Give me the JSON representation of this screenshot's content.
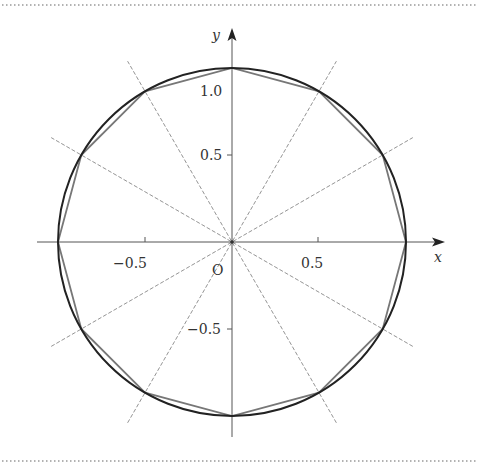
{
  "figure": {
    "type": "unit-circle-with-inscribed-dodecagon",
    "x_axis_label": "x",
    "y_axis_label": "y",
    "origin_label": "O",
    "x_ticks": [
      {
        "value": -0.5,
        "label": "−0.5"
      },
      {
        "value": 0.5,
        "label": "0.5"
      }
    ],
    "y_ticks": [
      {
        "value": 1.0,
        "label": "1.0"
      },
      {
        "value": 0.5,
        "label": "0.5"
      },
      {
        "value": -0.5,
        "label": "−0.5"
      }
    ],
    "circle_radius": 1,
    "polygon_sides": 12,
    "radial_line_angles_deg": [
      30,
      60,
      120,
      150
    ],
    "colors": {
      "circle": "#222222",
      "polygon": "#777777",
      "radial_lines": "#888888",
      "axes": "#555555",
      "border_dots": "#999999"
    }
  }
}
